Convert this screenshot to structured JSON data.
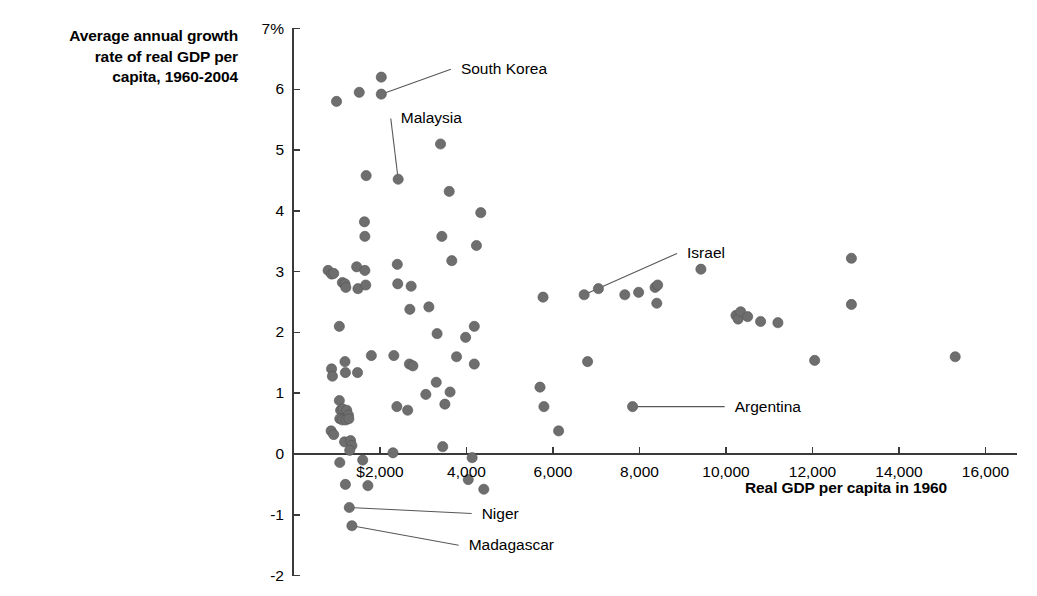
{
  "chart_data": {
    "type": "scatter",
    "title": "",
    "ylabel": "Average annual growth\nrate of real GDP per\ncapita, 1960-2004",
    "xlabel": "Real GDP per capita in 1960",
    "xlim": [
      600,
      16600
    ],
    "ylim": [
      -2,
      7
    ],
    "grid": false,
    "legend": null,
    "yticks": [
      {
        "value": 7,
        "label": "7%"
      },
      {
        "value": 6,
        "label": "6"
      },
      {
        "value": 5,
        "label": "5"
      },
      {
        "value": 4,
        "label": "4"
      },
      {
        "value": 3,
        "label": "3"
      },
      {
        "value": 2,
        "label": "2"
      },
      {
        "value": 1,
        "label": "1"
      },
      {
        "value": 0,
        "label": "0"
      },
      {
        "value": -1,
        "label": "-1"
      },
      {
        "value": -2,
        "label": "-2"
      }
    ],
    "xticks": [
      {
        "value": 2000,
        "label": "$2,000"
      },
      {
        "value": 4000,
        "label": "4,000"
      },
      {
        "value": 6000,
        "label": "6,000"
      },
      {
        "value": 8000,
        "label": "8,000"
      },
      {
        "value": 10000,
        "label": "10,000"
      },
      {
        "value": 12000,
        "label": "12,000"
      },
      {
        "value": 14000,
        "label": "14,000"
      },
      {
        "value": 16000,
        "label": "16,000"
      }
    ],
    "point_color": "#6e6e6e",
    "points": [
      {
        "x": 995,
        "y": 5.8
      },
      {
        "x": 1520,
        "y": 5.95
      },
      {
        "x": 2030,
        "y": 6.2
      },
      {
        "x": 2030,
        "y": 5.92
      },
      {
        "x": 1680,
        "y": 4.58
      },
      {
        "x": 2420,
        "y": 4.52
      },
      {
        "x": 3400,
        "y": 5.1
      },
      {
        "x": 1640,
        "y": 3.82
      },
      {
        "x": 1650,
        "y": 3.58
      },
      {
        "x": 3600,
        "y": 4.32
      },
      {
        "x": 4330,
        "y": 3.97
      },
      {
        "x": 3430,
        "y": 3.58
      },
      {
        "x": 3660,
        "y": 3.18
      },
      {
        "x": 4230,
        "y": 3.43
      },
      {
        "x": 800,
        "y": 3.02
      },
      {
        "x": 880,
        "y": 2.96
      },
      {
        "x": 930,
        "y": 2.97
      },
      {
        "x": 1130,
        "y": 2.82
      },
      {
        "x": 1190,
        "y": 2.8
      },
      {
        "x": 1210,
        "y": 2.74
      },
      {
        "x": 1460,
        "y": 3.08
      },
      {
        "x": 1490,
        "y": 2.72
      },
      {
        "x": 1670,
        "y": 2.78
      },
      {
        "x": 1650,
        "y": 3.02
      },
      {
        "x": 2400,
        "y": 3.12
      },
      {
        "x": 2410,
        "y": 2.8
      },
      {
        "x": 2720,
        "y": 2.76
      },
      {
        "x": 2690,
        "y": 2.38
      },
      {
        "x": 3130,
        "y": 2.42
      },
      {
        "x": 1060,
        "y": 2.1
      },
      {
        "x": 3320,
        "y": 1.98
      },
      {
        "x": 3980,
        "y": 1.92
      },
      {
        "x": 3770,
        "y": 1.6
      },
      {
        "x": 4180,
        "y": 2.1
      },
      {
        "x": 2320,
        "y": 1.62
      },
      {
        "x": 2680,
        "y": 1.48
      },
      {
        "x": 2760,
        "y": 1.45
      },
      {
        "x": 880,
        "y": 1.4
      },
      {
        "x": 900,
        "y": 1.28
      },
      {
        "x": 1190,
        "y": 1.52
      },
      {
        "x": 1200,
        "y": 1.34
      },
      {
        "x": 1480,
        "y": 1.34
      },
      {
        "x": 1800,
        "y": 1.62
      },
      {
        "x": 3300,
        "y": 1.18
      },
      {
        "x": 3620,
        "y": 1.02
      },
      {
        "x": 4180,
        "y": 1.48
      },
      {
        "x": 3060,
        "y": 0.98
      },
      {
        "x": 2640,
        "y": 0.72
      },
      {
        "x": 2390,
        "y": 0.78
      },
      {
        "x": 3500,
        "y": 0.82
      },
      {
        "x": 1060,
        "y": 0.88
      },
      {
        "x": 1090,
        "y": 0.72
      },
      {
        "x": 1140,
        "y": 0.74
      },
      {
        "x": 1230,
        "y": 0.72
      },
      {
        "x": 1270,
        "y": 0.64
      },
      {
        "x": 1070,
        "y": 0.58
      },
      {
        "x": 1130,
        "y": 0.56
      },
      {
        "x": 1210,
        "y": 0.56
      },
      {
        "x": 1280,
        "y": 0.58
      },
      {
        "x": 870,
        "y": 0.38
      },
      {
        "x": 930,
        "y": 0.32
      },
      {
        "x": 1180,
        "y": 0.2
      },
      {
        "x": 1320,
        "y": 0.22
      },
      {
        "x": 1350,
        "y": 0.14
      },
      {
        "x": 1300,
        "y": 0.06
      },
      {
        "x": 1070,
        "y": -0.14
      },
      {
        "x": 1600,
        "y": -0.1
      },
      {
        "x": 2300,
        "y": 0.02
      },
      {
        "x": 3450,
        "y": 0.12
      },
      {
        "x": 4130,
        "y": -0.06
      },
      {
        "x": 1200,
        "y": -0.5
      },
      {
        "x": 1720,
        "y": -0.52
      },
      {
        "x": 4040,
        "y": -0.42
      },
      {
        "x": 4400,
        "y": -0.58
      },
      {
        "x": 1290,
        "y": -0.88
      },
      {
        "x": 1350,
        "y": -1.18
      },
      {
        "x": 5770,
        "y": 2.58
      },
      {
        "x": 6130,
        "y": 0.38
      },
      {
        "x": 5700,
        "y": 1.1
      },
      {
        "x": 5790,
        "y": 0.78
      },
      {
        "x": 6720,
        "y": 2.62
      },
      {
        "x": 6800,
        "y": 1.52
      },
      {
        "x": 7050,
        "y": 2.72
      },
      {
        "x": 7660,
        "y": 2.62
      },
      {
        "x": 7980,
        "y": 2.66
      },
      {
        "x": 8360,
        "y": 2.74
      },
      {
        "x": 8420,
        "y": 2.78
      },
      {
        "x": 8400,
        "y": 2.48
      },
      {
        "x": 7840,
        "y": 0.78
      },
      {
        "x": 9420,
        "y": 3.04
      },
      {
        "x": 10230,
        "y": 2.28
      },
      {
        "x": 10280,
        "y": 2.22
      },
      {
        "x": 10340,
        "y": 2.34
      },
      {
        "x": 10500,
        "y": 2.26
      },
      {
        "x": 10800,
        "y": 2.18
      },
      {
        "x": 11200,
        "y": 2.16
      },
      {
        "x": 12050,
        "y": 1.54
      },
      {
        "x": 12900,
        "y": 3.22
      },
      {
        "x": 12900,
        "y": 2.46
      },
      {
        "x": 15300,
        "y": 1.6
      }
    ],
    "annotations": [
      {
        "label": "South Korea",
        "point_x": 2030,
        "point_y": 5.92,
        "label_x": 3870,
        "label_y": 6.33
      },
      {
        "label": "Malaysia",
        "point_x": 2420,
        "point_y": 4.52,
        "label_x": 2480,
        "label_y": 5.52
      },
      {
        "label": "Israel",
        "point_x": 6720,
        "point_y": 2.62,
        "label_x": 9100,
        "label_y": 3.3
      },
      {
        "label": "Argentina",
        "point_x": 7840,
        "point_y": 0.78,
        "label_x": 10200,
        "label_y": 0.78
      },
      {
        "label": "Niger",
        "point_x": 1290,
        "point_y": -0.88,
        "label_x": 4350,
        "label_y": -0.98
      },
      {
        "label": "Madagascar",
        "point_x": 1350,
        "point_y": -1.18,
        "label_x": 4050,
        "label_y": -1.5
      }
    ]
  }
}
